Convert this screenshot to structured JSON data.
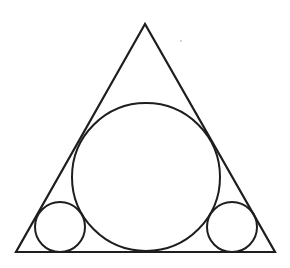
{
  "figure": {
    "width": 290,
    "height": 268,
    "stroke": "#1e1e1e",
    "background": "#ffffff",
    "triangle": {
      "points": [
        [
          145,
          24
        ],
        [
          16,
          252
        ],
        [
          275,
          252
        ]
      ]
    },
    "circles": [
      {
        "id": "large-circle",
        "cx": 146,
        "cy": 177,
        "r": 74
      },
      {
        "id": "small-circle-left",
        "cx": 60,
        "cy": 227,
        "r": 25
      },
      {
        "id": "small-circle-right",
        "cx": 232,
        "cy": 227,
        "r": 25
      }
    ],
    "speck": {
      "cx": 181,
      "cy": 41,
      "r": 0.7
    }
  }
}
